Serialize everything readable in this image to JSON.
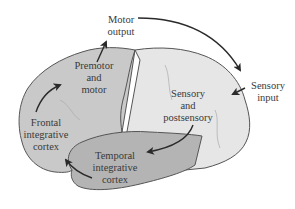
{
  "diagram": {
    "type": "brain-lateral-view-flow",
    "colors": {
      "frontal_region": "#c9c9c9",
      "posterior_region": "#e6e6e6",
      "temporal_region": "#b4b4b4",
      "outline": "#555555",
      "arrow": "#2a2a2a",
      "text": "#3a3a3a"
    },
    "labels": {
      "motor_output": [
        "Motor",
        "output"
      ],
      "premotor": [
        "Premotor",
        "and",
        "motor"
      ],
      "frontal": [
        "Frontal",
        "integrative",
        "cortex"
      ],
      "sensory_input": [
        "Sensory",
        "input"
      ],
      "sensory_post": [
        "Sensory",
        "and",
        "postsensory"
      ],
      "temporal": [
        "Temporal",
        "integrative",
        "cortex"
      ]
    },
    "flow": [
      "Sensory input → Sensory and postsensory",
      "Sensory and postsensory → Temporal integrative cortex",
      "Temporal integrative cortex → Frontal integrative cortex",
      "Frontal integrative cortex → Premotor and motor",
      "Premotor and motor → Motor output",
      "Motor output → Sensory input"
    ]
  }
}
